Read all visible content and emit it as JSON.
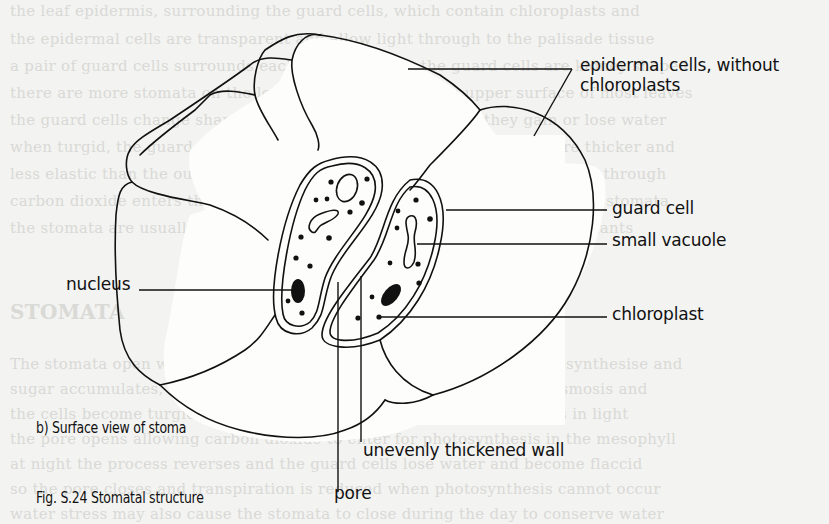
{
  "figure": {
    "subtitle": "b) Surface view of stoma",
    "caption": "Fig. S.24 Stomatal structure"
  },
  "labels": {
    "epidermal_line1": "epidermal cells, without",
    "epidermal_line2": "chloroplasts",
    "guard_cell": "guard cell",
    "small_vacuole": "small vacuole",
    "nucleus": "nucleus",
    "chloroplast": "chloroplast",
    "unevenly_thickened_wall": "unevenly thickened wall",
    "pore": "pore"
  },
  "background_text": {
    "lines": [
      "the leaf epidermis, surrounding the guard cells, which contain chloroplasts and",
      "the epidermal cells are transparent and allow light through to the palisade tissue",
      "a pair of guard cells surrounds each stomatal pore; the guard cells are kidney shaped",
      "there are more stomata on the lower surface than on the upper surface of most leaves",
      "the guard cells change shape to open and close the pore as they gain or lose water",
      "when turgid, the guard cells bend outwards because the inner walls are thicker and",
      "less elastic than the outer walls, so the stoma opens and gases can diffuse through",
      "carbon dioxide enters the leaf and oxygen and water vapour leave through stomata",
      "the stomata are usually open during the day and closed at night in most plants",
      "STOMATA",
      "",
      "The stomata open when light falls on the leaves; the guard cells photosynthesise and",
      "sugar accumulates, lowering the water potential so water enters by osmosis and",
      "the cells become turgid; potassium ions also move into the guard cells in light",
      "the pore opens allowing carbon dioxide to enter for photosynthesis in the mesophyll",
      "at night the process reverses and the guard cells lose water and become flaccid",
      "so the pore closes and transpiration is reduced when photosynthesis cannot occur",
      "water stress may also cause the stomata to close during the day to conserve water"
    ]
  }
}
